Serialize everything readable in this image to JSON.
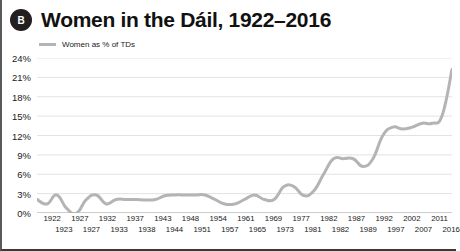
{
  "badge": {
    "label": "B"
  },
  "header": {
    "title": "Women in the Dáil, 1922–2016"
  },
  "legend": {
    "label": "Women as % of TDs",
    "color": "#b4b4b4"
  },
  "chart_data": {
    "type": "line",
    "title": "Women in the Dáil, 1922–2016",
    "xlabel": "",
    "ylabel": "",
    "ylim": [
      0,
      24
    ],
    "ytick_step": 3,
    "ytick_labels": [
      "24%",
      "21%",
      "18%",
      "15%",
      "12%",
      "9%",
      "6%",
      "3%",
      "0%"
    ],
    "ytick_values": [
      24,
      21,
      18,
      15,
      12,
      9,
      6,
      3,
      0
    ],
    "grid": true,
    "legend_position": "top-left",
    "series": [
      {
        "name": "Women as % of TDs",
        "color": "#b4b4b4",
        "values": [
          2.1,
          1.4,
          2.8,
          0.7,
          0.0,
          2.1,
          2.8,
          1.4,
          2.1,
          2.1,
          2.1,
          2.0,
          2.1,
          2.7,
          2.8,
          2.8,
          2.8,
          2.8,
          2.1,
          1.4,
          1.4,
          2.1,
          2.8,
          2.1,
          2.1,
          4.1,
          4.1,
          2.7,
          3.4,
          6.0,
          8.4,
          8.4,
          8.4,
          7.2,
          8.4,
          12.0,
          13.3,
          13.0,
          13.3,
          13.9,
          13.9,
          15.1,
          22.2
        ],
        "x": [
          1922,
          1923,
          1927,
          1927,
          1932,
          1933,
          1937,
          1938,
          1943,
          1944,
          1948,
          1951,
          1954,
          1957,
          1961,
          1965,
          1969,
          1973,
          1977,
          1981,
          1982,
          1982,
          1987,
          1989,
          1992,
          1997,
          2002,
          2007,
          2011,
          2016,
          0,
          0,
          0,
          0,
          0,
          0,
          0,
          0,
          0,
          0,
          0,
          0,
          0
        ]
      }
    ],
    "xtick_labels_top": [
      "1922",
      "1927",
      "1932",
      "1937",
      "1943",
      "1948",
      "1954",
      "1961",
      "1969",
      "1977",
      "1982",
      "1987",
      "1992",
      "2002",
      "2011"
    ],
    "xtick_labels_bottom": [
      "1923",
      "1927",
      "1933",
      "1938",
      "1944",
      "1951",
      "1957",
      "1965",
      "1973",
      "1981",
      "1982",
      "1989",
      "1997",
      "2007",
      "2016"
    ]
  }
}
